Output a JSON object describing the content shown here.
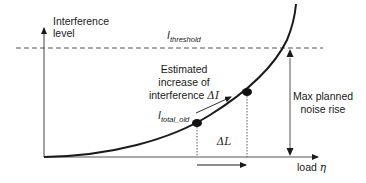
{
  "diagram": {
    "y_axis": {
      "label_line1": "Interference",
      "label_line2": "level"
    },
    "x_axis": {
      "label": "load",
      "symbol": "η"
    },
    "threshold": {
      "symbol": "I",
      "subscript": "threshold"
    },
    "estimate_text": {
      "line1": "Estimated",
      "line2": "increase of",
      "line3": "interference ",
      "delta_symbol": "ΔI"
    },
    "old_point": {
      "symbol": "I",
      "subscript": "total_old"
    },
    "delta_load": "ΔL",
    "noise_rise": {
      "line1": "Max planned",
      "line2": "noise rise"
    },
    "colors": {
      "line": "#1a1a1a",
      "axis": "#555555",
      "background": "#ffffff"
    }
  }
}
